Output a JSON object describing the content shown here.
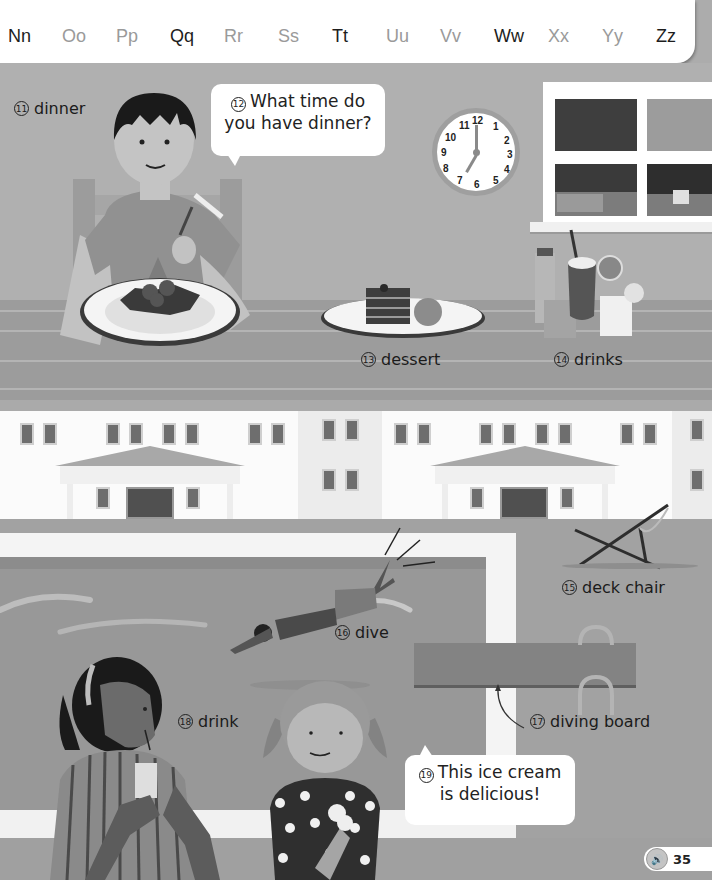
{
  "alphabet": {
    "letters": [
      {
        "text": "Nn",
        "style": "dark"
      },
      {
        "text": "Oo",
        "style": "light"
      },
      {
        "text": "Pp",
        "style": "light"
      },
      {
        "text": "Qq",
        "style": "dark"
      },
      {
        "text": "Rr",
        "style": "light"
      },
      {
        "text": "Ss",
        "style": "light"
      },
      {
        "text": "Tt",
        "style": "dark"
      },
      {
        "text": "Uu",
        "style": "light"
      },
      {
        "text": "Vv",
        "style": "light"
      },
      {
        "text": "Ww",
        "style": "dark"
      },
      {
        "text": "Xx",
        "style": "light"
      },
      {
        "text": "Yy",
        "style": "light"
      },
      {
        "text": "Zz",
        "style": "dark"
      }
    ]
  },
  "vocab": {
    "dinner": {
      "num": "11",
      "label": "dinner"
    },
    "question": {
      "num": "12",
      "line1": "What time do",
      "line2": "you have dinner?"
    },
    "dessert": {
      "num": "13",
      "label": "dessert"
    },
    "drinks": {
      "num": "14",
      "label": "drinks"
    },
    "deck_chair": {
      "num": "15",
      "label": "deck chair"
    },
    "dive": {
      "num": "16",
      "label": "dive"
    },
    "diving_board": {
      "num": "17",
      "label": "diving board"
    },
    "drink": {
      "num": "18",
      "label": "drink"
    },
    "ice_cream": {
      "num": "19",
      "line1": "This ice cream",
      "line2": "is delicious!"
    }
  },
  "clock": {
    "numbers": [
      "12",
      "1",
      "2",
      "3",
      "4",
      "5",
      "6",
      "7",
      "8",
      "9",
      "10",
      "11"
    ],
    "time": "7:00"
  },
  "audio": {
    "icon": "speaker-icon",
    "page_number": "35"
  }
}
